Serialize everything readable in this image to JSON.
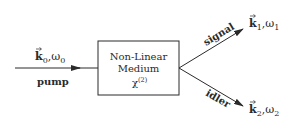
{
  "diagram": {
    "title": "",
    "medium": {
      "line1": "Non-Linear",
      "line2": "Medium",
      "chi_symbol": "χ",
      "chi_order": "(2)"
    },
    "pump": {
      "label": "pump",
      "k": "k",
      "k_sub": "0",
      "sep": ",",
      "omega": "ω",
      "omega_sub": "0"
    },
    "signal": {
      "label": "signal",
      "k": "k",
      "k_sub": "1",
      "sep": ",",
      "omega": "ω",
      "omega_sub": "1"
    },
    "idler": {
      "label": "idler",
      "k": "k",
      "k_sub": "2",
      "sep": ",",
      "omega": "ω",
      "omega_sub": "2"
    },
    "colors": {
      "stroke": "#2a2a2a",
      "background": "#ffffff"
    }
  }
}
